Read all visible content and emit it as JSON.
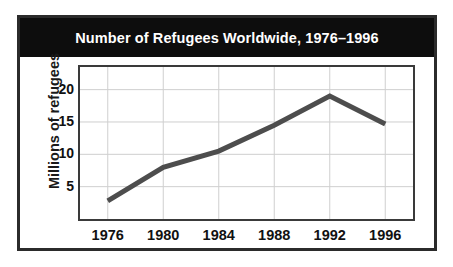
{
  "chart_data": {
    "type": "line",
    "title": "Number of Refugees Worldwide, 1976–1996",
    "xlabel": "",
    "ylabel": "Millions of refugees",
    "categories": [
      "1976",
      "1980",
      "1984",
      "1988",
      "1992",
      "1996"
    ],
    "x": [
      1976,
      1980,
      1984,
      1988,
      1992,
      1996
    ],
    "values": [
      2.8,
      8.0,
      10.5,
      14.5,
      19.0,
      14.7
    ],
    "series": [
      {
        "name": "Refugees worldwide",
        "values": [
          2.8,
          8.0,
          10.5,
          14.5,
          19.0,
          14.7
        ]
      }
    ],
    "ylim": [
      0,
      23.5
    ],
    "xlim": [
      1974,
      1998
    ],
    "yticks": [
      5,
      10,
      15,
      20
    ],
    "ytick_labels": [
      "5",
      "10",
      "15",
      "20"
    ],
    "xticks": [
      1976,
      1980,
      1984,
      1988,
      1992,
      1996
    ],
    "xtick_labels": [
      "1976",
      "1980",
      "1984",
      "1988",
      "1992",
      "1996"
    ],
    "grid": true,
    "grid_color": "#cfcfcf",
    "legend": false,
    "legend_position": "none",
    "line_color": "#4d4d4d",
    "line_width": 5,
    "markers": false,
    "title_background": "#0d0d0d",
    "title_color": "#ffffff",
    "plot_background": "#ffffff",
    "frame_color": "#3a3a3a",
    "border_color": "#2b2b2b"
  }
}
